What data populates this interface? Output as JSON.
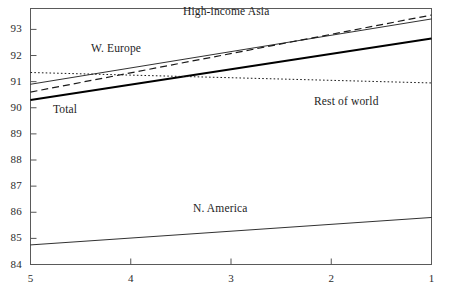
{
  "chart_data": {
    "type": "line",
    "title": "",
    "subtitle": "",
    "xlabel": "",
    "ylabel": "",
    "xlim": [
      5,
      1
    ],
    "ylim": [
      84,
      93.8
    ],
    "x_axis_reversed": true,
    "grid": false,
    "legend_position": "inline-annotations",
    "x_tick_labels": [
      "5",
      "4",
      "3",
      "2",
      "1"
    ],
    "x_ticks": [
      5,
      4,
      3,
      2,
      1
    ],
    "y_tick_labels": [
      "93",
      "92",
      "91",
      "90",
      "89",
      "88",
      "87",
      "86",
      "85",
      "84"
    ],
    "y_ticks": [
      93,
      92,
      91,
      90,
      89,
      88,
      87,
      86,
      85,
      84
    ],
    "x": [
      5,
      1
    ],
    "series": [
      {
        "name": "High-income Asia",
        "style": "dashed",
        "width": 1.2,
        "color": "#1a1a1a",
        "values": [
          90.6,
          93.55
        ],
        "label_x": 3.05,
        "label_y": 93.72
      },
      {
        "name": "W. Europe",
        "style": "solid-thin",
        "width": 0.9,
        "color": "#1a1a1a",
        "values": [
          90.9,
          93.4
        ],
        "label_x": 4.15,
        "label_y": 92.3
      },
      {
        "name": "Total",
        "style": "solid-thick",
        "width": 2.1,
        "color": "#000000",
        "values": [
          90.3,
          92.65
        ],
        "label_x": 4.66,
        "label_y": 89.95
      },
      {
        "name": "Rest of world",
        "style": "dotted",
        "width": 1.0,
        "color": "#1a1a1a",
        "values": [
          91.35,
          90.95
        ],
        "label_x": 1.85,
        "label_y": 90.25
      },
      {
        "name": "N. America",
        "style": "solid-thin",
        "width": 0.9,
        "color": "#1a1a1a",
        "values": [
          84.75,
          85.8
        ],
        "label_x": 3.1,
        "label_y": 86.15
      }
    ]
  },
  "axes": {
    "frame_color": "#555555",
    "tick_color": "#555555"
  }
}
